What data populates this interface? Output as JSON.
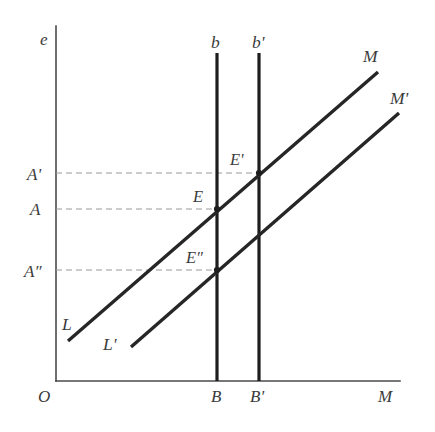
{
  "figure": {
    "kind": "economics-line-diagram",
    "background_color": "#ffffff",
    "line_color": "#262626",
    "axis_color": "#4a4a4a",
    "guide_color": "#9a9a9a"
  },
  "axes": {
    "y_axis_label": "e",
    "x_axis_label": "M",
    "origin_label": "O"
  },
  "tick_labels": {
    "y": [
      "A'",
      "A",
      "A″"
    ],
    "x": [
      "B",
      "B'"
    ]
  },
  "curve_labels": {
    "lm_start": "L",
    "lm_end": "M",
    "lm_prime_start": "L'",
    "lm_prime_end": "M'",
    "b_line": "b",
    "b_prime_line": "b'"
  },
  "point_labels": [
    "E'",
    "E",
    "E″"
  ],
  "chart_data": {
    "type": "line",
    "title": "",
    "xlabel": "M",
    "ylabel": "e",
    "grid": false,
    "legend": "none",
    "xlim": [
      56,
      400
    ],
    "ylim": [
      381,
      30
    ],
    "axis_geometry": {
      "y_axis_x": 56,
      "y_axis_top": 26,
      "x_axis_y": 381,
      "x_axis_right": 400
    },
    "series": [
      {
        "name": "LM",
        "label_start": "L",
        "label_end": "M",
        "points": [
          [
            68,
            341
          ],
          [
            378,
            72
          ]
        ]
      },
      {
        "name": "LM'",
        "label_start": "L'",
        "label_end": "M'",
        "points": [
          [
            131,
            347
          ],
          [
            399,
            113
          ]
        ]
      },
      {
        "name": "b",
        "label_end": "b",
        "points": [
          [
            217,
            53
          ],
          [
            217,
            381
          ]
        ]
      },
      {
        "name": "b'",
        "label_end": "b'",
        "points": [
          [
            259,
            53
          ],
          [
            259,
            381
          ]
        ]
      }
    ],
    "equilibria": [
      {
        "label": "E'",
        "x": 259,
        "y": 173,
        "y_tick": "A'",
        "x_tick": "B'"
      },
      {
        "label": "E",
        "x": 217,
        "y": 209,
        "y_tick": "A",
        "x_tick": "B"
      },
      {
        "label": "E″",
        "x": 217,
        "y": 270,
        "y_tick": "A″",
        "x_tick": "B"
      }
    ],
    "guides": [
      {
        "tick": "A'",
        "y": 173,
        "from_x": 56,
        "to_x": 259
      },
      {
        "tick": "A",
        "y": 209,
        "from_x": 56,
        "to_x": 217
      },
      {
        "tick": "A″",
        "y": 270,
        "from_x": 56,
        "to_x": 217
      }
    ],
    "label_positions": {
      "e": [
        40,
        45
      ],
      "O": [
        38,
        402
      ],
      "M_axis": [
        378,
        402
      ],
      "b": [
        211,
        48
      ],
      "b_prime": [
        252,
        48
      ],
      "M_curve": [
        363,
        62
      ],
      "M_prime_curve": [
        392,
        104
      ],
      "L": [
        62,
        324
      ],
      "L_prime": [
        104,
        344
      ],
      "A_prime": [
        27,
        180
      ],
      "A": [
        30,
        215
      ],
      "A_dprime": [
        24,
        277
      ],
      "E_prime": [
        230,
        163
      ],
      "E": [
        193,
        200
      ],
      "E_dprime": [
        188,
        261
      ]
    }
  }
}
